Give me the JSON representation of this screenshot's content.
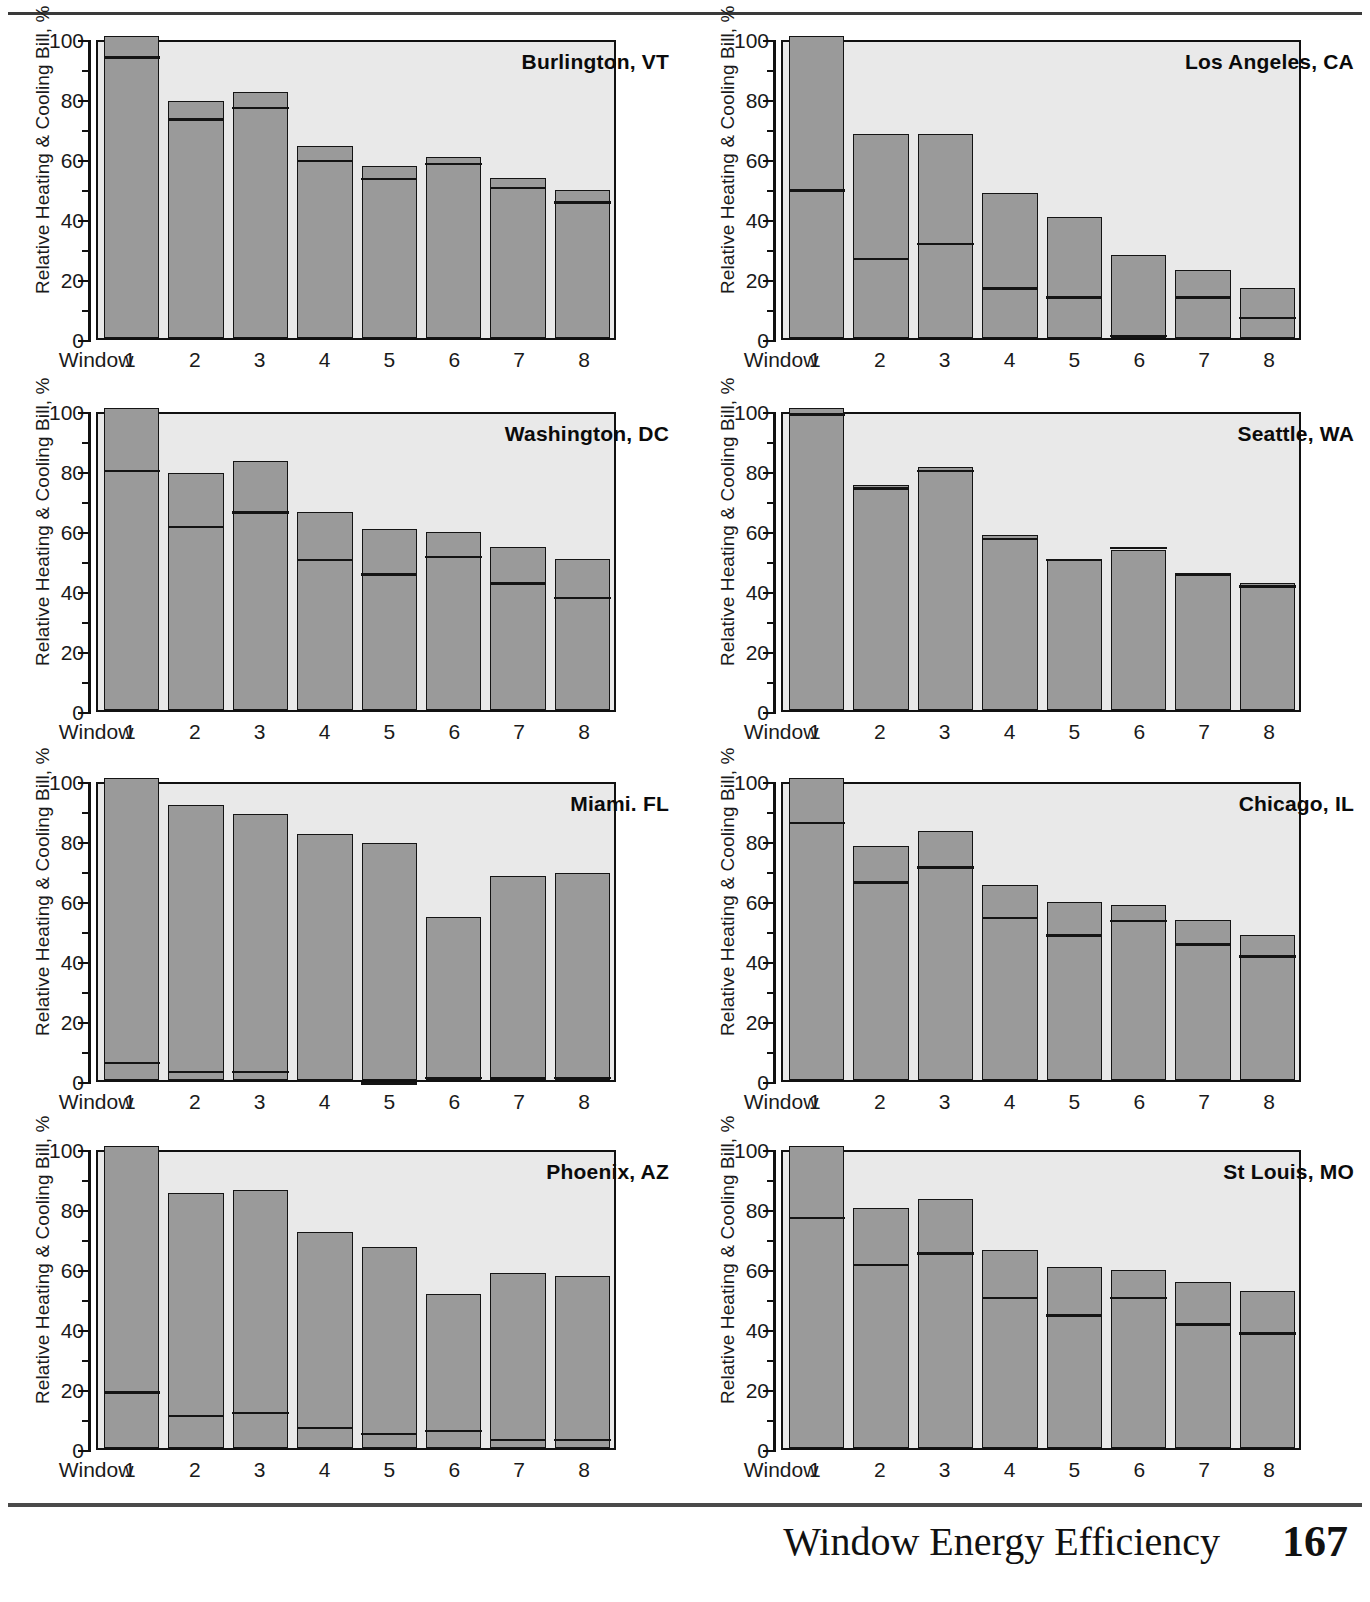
{
  "footer": {
    "title": "Window Energy Efficiency",
    "page_number": "167"
  },
  "axis": {
    "y_title": "Relative Heating & Cooling Bill, %",
    "y_ticks": [
      "0",
      "20",
      "40",
      "60",
      "80",
      "100"
    ],
    "x_prefix": "Window",
    "x_ticks": [
      "1",
      "2",
      "3",
      "4",
      "5",
      "6",
      "7",
      "8"
    ]
  },
  "colors": {
    "bar_fill": "#9a9a9a",
    "bar_outline": "#141414",
    "plot_background": "#e9e9e9",
    "page_background": "#ffffff",
    "rule": "#3a3a3a"
  },
  "chart_data": {
    "type": "bar",
    "subtype": "stacked",
    "title": "",
    "xlabel": "Window",
    "ylabel": "Relative Heating & Cooling Bill, %",
    "ylim": [
      0,
      100
    ],
    "y_major_step": 20,
    "y_minor_step": 10,
    "grid": false,
    "legend": "none",
    "categories": [
      "1",
      "2",
      "3",
      "4",
      "5",
      "6",
      "7",
      "8"
    ],
    "series_names": [
      "Heating",
      "Cooling"
    ],
    "note": "Each bar is a stack: lower segment = heating, upper segment = cooling; the horizontal rule inside each bar marks the split. 'total' is the bar top, 'split' is the divider height.",
    "panels": [
      {
        "city": "Burlington, VT",
        "total": [
          102,
          80,
          83,
          65,
          58,
          61,
          54,
          50
        ],
        "split": [
          94,
          73,
          77,
          59,
          53,
          58,
          50,
          45
        ],
        "heating": [
          94,
          73,
          77,
          59,
          53,
          58,
          50,
          45
        ],
        "cooling": [
          8,
          7,
          6,
          6,
          5,
          3,
          4,
          5
        ]
      },
      {
        "city": "Los Angeles, CA",
        "total": [
          102,
          69,
          69,
          49,
          41,
          28,
          23,
          17
        ],
        "split": [
          49,
          26,
          31,
          16,
          13,
          0,
          13,
          6
        ],
        "heating": [
          49,
          26,
          31,
          16,
          13,
          0,
          13,
          6
        ],
        "cooling": [
          53,
          43,
          38,
          33,
          28,
          28,
          10,
          11
        ]
      },
      {
        "city": "Washington, DC",
        "total": [
          102,
          80,
          84,
          67,
          61,
          60,
          55,
          51
        ],
        "split": [
          80,
          61,
          66,
          50,
          45,
          51,
          42,
          37
        ],
        "heating": [
          80,
          61,
          66,
          50,
          45,
          51,
          42,
          37
        ],
        "cooling": [
          22,
          19,
          18,
          17,
          16,
          9,
          13,
          14
        ]
      },
      {
        "city": "Seattle, WA",
        "total": [
          102,
          76,
          82,
          59,
          51,
          54,
          46,
          43
        ],
        "split": [
          99,
          74,
          80,
          57,
          50,
          54,
          45,
          41
        ],
        "heating": [
          99,
          74,
          80,
          57,
          50,
          54,
          45,
          41
        ],
        "cooling": [
          3,
          2,
          2,
          2,
          1,
          0,
          1,
          2
        ]
      },
      {
        "city": "Miami. FL",
        "total": [
          102,
          93,
          90,
          83,
          80,
          55,
          69,
          70
        ],
        "split": [
          5,
          2,
          2,
          -1,
          -2,
          0,
          0,
          0
        ],
        "heating": [
          5,
          2,
          2,
          0,
          0,
          0,
          0,
          0
        ],
        "cooling": [
          97,
          91,
          88,
          83,
          80,
          55,
          69,
          70
        ]
      },
      {
        "city": "Chicago, IL",
        "total": [
          102,
          79,
          84,
          66,
          60,
          59,
          54,
          49
        ],
        "split": [
          86,
          66,
          71,
          54,
          48,
          53,
          45,
          41
        ],
        "heating": [
          86,
          66,
          71,
          54,
          48,
          53,
          45,
          41
        ],
        "cooling": [
          16,
          13,
          13,
          12,
          12,
          6,
          9,
          8
        ]
      },
      {
        "city": "Phoenix, AZ",
        "total": [
          102,
          86,
          87,
          73,
          68,
          52,
          59,
          58
        ],
        "split": [
          18,
          10,
          11,
          6,
          4,
          5,
          2,
          2
        ],
        "heating": [
          18,
          10,
          11,
          6,
          4,
          5,
          2,
          2
        ],
        "cooling": [
          84,
          76,
          76,
          67,
          64,
          47,
          57,
          56
        ]
      },
      {
        "city": "St Louis, MO",
        "total": [
          102,
          81,
          84,
          67,
          61,
          60,
          56,
          53
        ],
        "split": [
          77,
          61,
          65,
          50,
          44,
          50,
          41,
          38
        ],
        "heating": [
          77,
          61,
          65,
          50,
          44,
          50,
          41,
          38
        ],
        "cooling": [
          25,
          20,
          19,
          17,
          17,
          10,
          15,
          15
        ]
      }
    ]
  }
}
